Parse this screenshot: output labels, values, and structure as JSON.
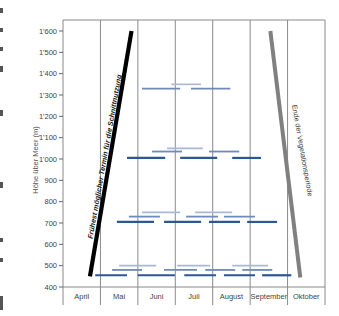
{
  "chart_data": {
    "type": "line",
    "title": "",
    "xlabel": "",
    "ylabel": "Höhe über Meer (m)",
    "ylim": [
      400,
      1600
    ],
    "yticks": [
      400,
      500,
      600,
      700,
      800,
      900,
      1000,
      1100,
      1200,
      1300,
      1400,
      1500,
      1600
    ],
    "ytick_labels": [
      "400",
      "500",
      "600",
      "700",
      "800",
      "900",
      "1'000",
      "1'100",
      "1'200",
      "1'300",
      "1'400",
      "1'500",
      "1'600"
    ],
    "categories": [
      "April",
      "Mai",
      "Juni",
      "Juli",
      "August",
      "September",
      "Oktober"
    ],
    "grid": "vertical month dividers",
    "lines": [
      {
        "name": "Frühest möglicher Termin für die Schnittnutzung",
        "color": "#000000",
        "points": [
          {
            "month": 0.72,
            "height": 450
          },
          {
            "month": 1.83,
            "height": 1600
          }
        ]
      },
      {
        "name": "Ende der Vegetationsperiode",
        "color": "#808080",
        "points": [
          {
            "month": 5.54,
            "height": 1600
          },
          {
            "month": 6.34,
            "height": 445
          }
        ]
      }
    ],
    "series": [
      {
        "name": "light",
        "color": "#a9b9d4",
        "bars": [
          {
            "height": 1350,
            "start": 2.89,
            "end": 3.69
          },
          {
            "height": 1050,
            "start": 2.78,
            "end": 3.74
          },
          {
            "height": 750,
            "start": 2.11,
            "end": 3.13
          },
          {
            "height": 750,
            "start": 3.53,
            "end": 4.52
          },
          {
            "height": 500,
            "start": 1.5,
            "end": 2.49
          },
          {
            "height": 500,
            "start": 3.05,
            "end": 3.93
          },
          {
            "height": 500,
            "start": 4.52,
            "end": 5.48
          }
        ]
      },
      {
        "name": "medium",
        "color": "#6f89b8",
        "bars": [
          {
            "height": 1330,
            "start": 2.11,
            "end": 3.13
          },
          {
            "height": 1330,
            "start": 3.42,
            "end": 4.47
          },
          {
            "height": 1035,
            "start": 2.38,
            "end": 3.18
          },
          {
            "height": 1035,
            "start": 3.9,
            "end": 4.71
          },
          {
            "height": 730,
            "start": 1.76,
            "end": 2.59
          },
          {
            "height": 730,
            "start": 3.29,
            "end": 4.14
          },
          {
            "height": 730,
            "start": 4.3,
            "end": 5.13
          },
          {
            "height": 480,
            "start": 1.31,
            "end": 2.11
          },
          {
            "height": 480,
            "start": 2.7,
            "end": 3.58
          },
          {
            "height": 480,
            "start": 3.8,
            "end": 4.6
          },
          {
            "height": 480,
            "start": 4.79,
            "end": 5.59
          }
        ]
      },
      {
        "name": "dark",
        "color": "#2b5797",
        "bars": [
          {
            "height": 1005,
            "start": 1.71,
            "end": 2.73
          },
          {
            "height": 1005,
            "start": 3.13,
            "end": 4.12
          },
          {
            "height": 1005,
            "start": 4.52,
            "end": 5.29
          },
          {
            "height": 705,
            "start": 1.44,
            "end": 2.43
          },
          {
            "height": 705,
            "start": 2.7,
            "end": 3.69
          },
          {
            "height": 705,
            "start": 3.9,
            "end": 4.73
          },
          {
            "height": 705,
            "start": 4.92,
            "end": 5.72
          },
          {
            "height": 455,
            "start": 0.86,
            "end": 1.71
          },
          {
            "height": 455,
            "start": 2.0,
            "end": 2.99
          },
          {
            "height": 455,
            "start": 3.24,
            "end": 4.09
          },
          {
            "height": 455,
            "start": 4.3,
            "end": 5.13
          },
          {
            "height": 455,
            "start": 5.32,
            "end": 6.1
          }
        ]
      }
    ],
    "annotations": [
      "Frühest möglicher Termin für die Schnittnutzung",
      "Ende der Vegetationsperiode"
    ]
  },
  "labels": {
    "ylabel": "Höhe über Meer (m)",
    "early_line": "Frühest möglicher Termin für die Schnittnutzung",
    "end_line": "Ende der Vegetationsperiode"
  }
}
